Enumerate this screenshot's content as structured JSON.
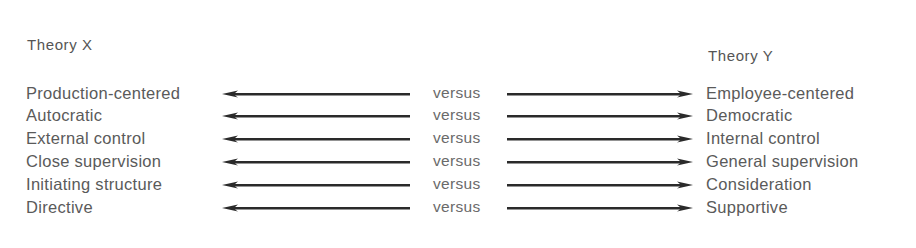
{
  "diagram": {
    "left_heading": "Theory X",
    "right_heading": "Theory Y",
    "connector_label": "versus",
    "rows": [
      {
        "left": "Production-centered",
        "connector": "versus",
        "right": "Employee-centered"
      },
      {
        "left": "Autocratic",
        "connector": "versus",
        "right": "Democratic"
      },
      {
        "left": "External control",
        "connector": "versus",
        "right": "Internal control"
      },
      {
        "left": "Close supervision",
        "connector": "versus",
        "right": "General supervision"
      },
      {
        "left": "Initiating structure",
        "connector": "versus",
        "right": "Consideration"
      },
      {
        "left": "Directive",
        "connector": "versus",
        "right": "Supportive"
      }
    ],
    "arrow_color": "#2a2a2a",
    "text_color": "#5a5a5a"
  }
}
